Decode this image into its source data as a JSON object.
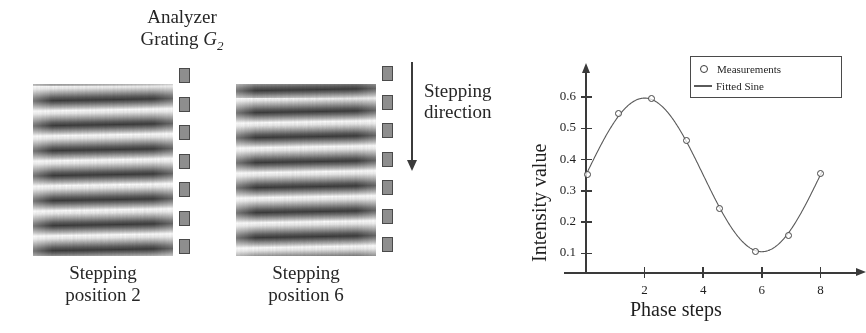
{
  "figure": {
    "left_panel": {
      "analyzer_label_line1": "Analyzer",
      "analyzer_label_line2": "Grating",
      "analyzer_symbol": "G",
      "analyzer_symbol_subscript": "2",
      "stepping_direction_line1": "Stepping",
      "stepping_direction_line2": "direction",
      "arrow_icon": "down-arrow-icon",
      "panels": [
        {
          "caption_line1": "Stepping",
          "caption_line2": "position 2",
          "position_number": "2",
          "grating_count": 7,
          "fringe_count": 7
        },
        {
          "caption_line1": "Stepping",
          "caption_line2": "position 6",
          "position_number": "6",
          "grating_count": 7,
          "fringe_count": 7
        }
      ]
    }
  },
  "chart_data": {
    "type": "scatter",
    "title": "",
    "xlabel": "Phase steps",
    "ylabel": "Intensity value",
    "xlim": [
      0,
      8.6
    ],
    "ylim": [
      0.04,
      0.655
    ],
    "grid": false,
    "legend_position": "top-right",
    "xticks": [
      2,
      4,
      6,
      8
    ],
    "xtick_labels": [
      "2",
      "4",
      "6",
      "8"
    ],
    "yticks": [
      0.1,
      0.2,
      0.3,
      0.4,
      0.5,
      0.6
    ],
    "ytick_labels": [
      "0.1",
      "0.2",
      "0.3",
      "0.4",
      "0.5",
      "0.6"
    ],
    "series": [
      {
        "name": "Measurements",
        "marker": "circle",
        "x": [
          0.05,
          1.12,
          2.22,
          3.42,
          4.55,
          5.78,
          6.9,
          8.0
        ],
        "y": [
          0.352,
          0.547,
          0.596,
          0.461,
          0.243,
          0.106,
          0.158,
          0.355
        ]
      },
      {
        "name": "Fitted Sine",
        "marker": "line",
        "fit": {
          "offset": 0.351,
          "amplitude": 0.246,
          "period": 8.0,
          "phase_deg": 0.0
        }
      }
    ],
    "legend": [
      "Measurements",
      "Fitted Sine"
    ],
    "colors": {
      "marker_edge": "#444444",
      "line": "#5a5a5a",
      "axis": "#3a3a3a",
      "text": "#1f1f1f"
    }
  }
}
